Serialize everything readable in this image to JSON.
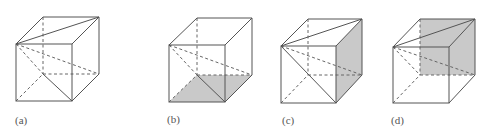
{
  "figure": {
    "shade_color": "#c9c9c9",
    "line_color": "#555555",
    "panels": [
      {
        "id": "a",
        "label": "(a)",
        "shaded_face": "none",
        "description": "Cube with top-face diagonal and hidden lines from front-top-left vertex to back-bottom vertices"
      },
      {
        "id": "b",
        "label": "(b)",
        "shaded_face": "bottom",
        "description": "Cube with shaded bottom face"
      },
      {
        "id": "c",
        "label": "(c)",
        "shaded_face": "right",
        "description": "Cube with shaded right face and front-face diagonal"
      },
      {
        "id": "d",
        "label": "(d)",
        "shaded_face": "back",
        "description": "Cube with shaded back face and top-face diagonal"
      }
    ]
  }
}
